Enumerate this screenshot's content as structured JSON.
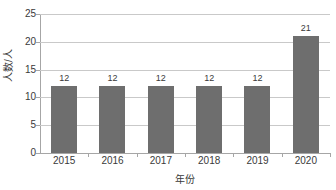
{
  "chart_data": {
    "type": "bar",
    "title": "",
    "subtitle": "",
    "categories": [
      "2015",
      "2016",
      "2017",
      "2018",
      "2019",
      "2020"
    ],
    "values": [
      12,
      12,
      12,
      12,
      12,
      21
    ],
    "data_labels": [
      "12",
      "12",
      "12",
      "12",
      "12",
      "21"
    ],
    "xlabel": "年份",
    "ylabel": "人数/人",
    "ylim": [
      0,
      25
    ],
    "yticks": [
      0,
      5,
      10,
      15,
      20,
      25
    ],
    "ytick_labels": [
      "0",
      "5",
      "10",
      "15",
      "20",
      "25"
    ],
    "grid": true,
    "legend": false,
    "legend_position": "none",
    "series": [
      {
        "name": "人数",
        "values": [
          12,
          12,
          12,
          12,
          12,
          21
        ],
        "color": "#6E6E6E"
      }
    ]
  },
  "colors": {
    "bar_fill": "#6E6E6E",
    "gridline": "#C9C9C9",
    "axis_line": "#A6A6A6",
    "text": "#3A3A3A",
    "background": "#FFFFFF"
  }
}
